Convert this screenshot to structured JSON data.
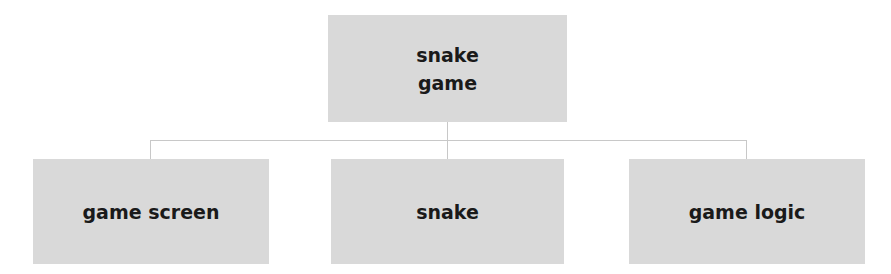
{
  "diagram": {
    "type": "hierarchy",
    "root": {
      "label": "snake\ngame"
    },
    "children": [
      {
        "label": "game screen"
      },
      {
        "label": "snake"
      },
      {
        "label": "game logic"
      }
    ],
    "colors": {
      "node_fill": "#d9d9d9",
      "text": "#1a1a1a",
      "connector": "#c8c8c8",
      "background": "#ffffff"
    }
  }
}
